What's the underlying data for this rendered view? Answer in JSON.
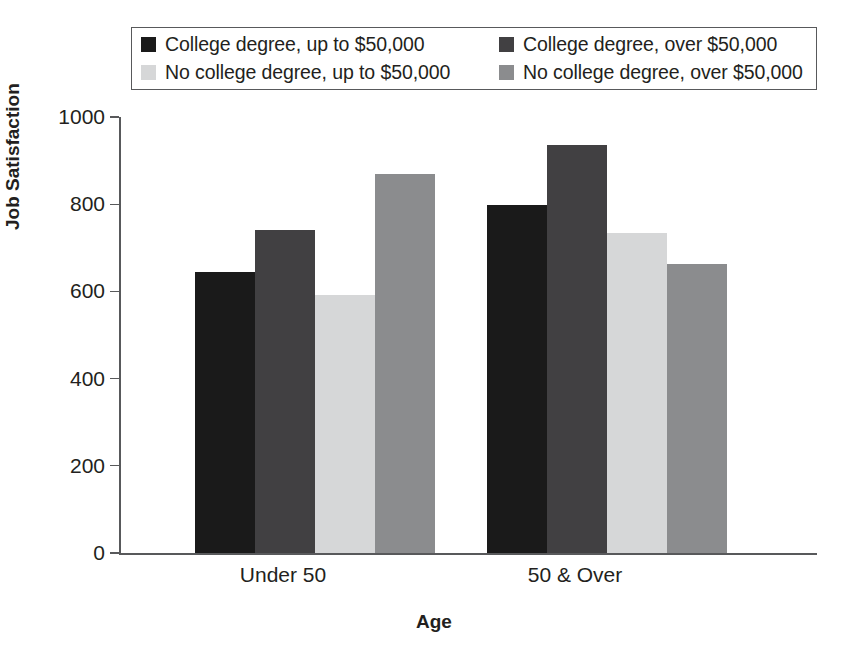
{
  "chart_data": {
    "type": "bar",
    "title": "",
    "xlabel": "Age",
    "ylabel": "Job Satisfaction",
    "categories": [
      "Under 50",
      "50 & Over"
    ],
    "ylim": [
      0,
      1000
    ],
    "yticks": [
      0,
      200,
      400,
      600,
      800,
      1000
    ],
    "ytick_labels": [
      "0",
      "200",
      "400",
      "600",
      "800",
      "1000"
    ],
    "grid": false,
    "legend_position": "top",
    "series": [
      {
        "name": "College degree, up to $50,000",
        "color": "#1a1a1a",
        "values": [
          645,
          798
        ]
      },
      {
        "name": "College degree, over $50,000",
        "color": "#414042",
        "values": [
          740,
          935
        ]
      },
      {
        "name": "No college degree, up to $50,000",
        "color": "#d6d7d8",
        "values": [
          592,
          733
        ]
      },
      {
        "name": "No college degree, over $50,000",
        "color": "#8b8c8e",
        "values": [
          870,
          662
        ]
      }
    ]
  },
  "legend": {
    "entries": [
      {
        "label": "College degree, up to $50,000",
        "swatch_color": "#1a1a1a"
      },
      {
        "label": "College degree, over $50,000",
        "swatch_color": "#414042"
      },
      {
        "label": "No college degree, up to $50,000",
        "swatch_color": "#d6d7d8"
      },
      {
        "label": "No college degree, over $50,000",
        "swatch_color": "#8b8c8e"
      }
    ]
  },
  "axes": {
    "y_title": "Job Satisfaction",
    "x_title": "Age",
    "y_tick_labels": [
      "1000",
      "800",
      "600",
      "400",
      "200",
      "0"
    ],
    "x_category_labels": [
      "Under 50",
      "50 & Over"
    ]
  },
  "colors": {
    "axis": "#58595b",
    "text": "#231f20",
    "background": "#ffffff"
  }
}
